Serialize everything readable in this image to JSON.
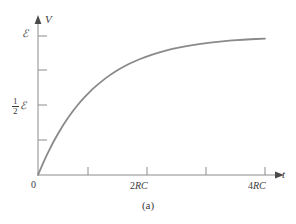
{
  "figure": {
    "caption": "(a)",
    "axis_color": "#8c8c8c",
    "curve_color": "#8a8a8a",
    "text_color": "#3c3c3c",
    "background": "#ffffff"
  },
  "axes": {
    "y_name": "V",
    "x_name": "t",
    "origin_label": "0"
  },
  "labels": {
    "emf": "ℰ",
    "half_numerator": "1",
    "half_denominator": "2",
    "tick_2rc_coeff": "2",
    "tick_2rc_unit": "RC",
    "tick_4rc_coeff": "4",
    "tick_4rc_unit": "RC"
  },
  "chart_data": {
    "type": "line",
    "title": "",
    "subtitle": "",
    "xlabel": "t",
    "ylabel": "V",
    "grid": false,
    "legend": null,
    "xlim": [
      0,
      4.6
    ],
    "ylim": [
      0,
      1.17
    ],
    "x_tick_values": [
      1,
      2,
      3,
      4
    ],
    "x_tick_labels": [
      "",
      "2RC",
      "",
      "4RC"
    ],
    "x_tick_unit": "RC",
    "y_tick_values": [
      0.25,
      0.5,
      0.75,
      1.0
    ],
    "y_tick_labels": [
      "",
      "½ℰ",
      "",
      "ℰ"
    ],
    "origin_label": "0",
    "annotations": [
      "(a)"
    ],
    "series": [
      {
        "name": "V(t) = ℰ(1 − e^(−t/RC))",
        "x": [
          0,
          0.1,
          0.2,
          0.3,
          0.4,
          0.5,
          0.6,
          0.7,
          0.8,
          0.9,
          1.0,
          1.2,
          1.4,
          1.6,
          1.8,
          2.0,
          2.25,
          2.5,
          2.75,
          3.0,
          3.25,
          3.5,
          3.75,
          4.0
        ],
        "y": [
          0,
          0.0952,
          0.1813,
          0.2592,
          0.3297,
          0.3935,
          0.4512,
          0.5034,
          0.5507,
          0.5934,
          0.6321,
          0.6988,
          0.7534,
          0.7981,
          0.8347,
          0.8647,
          0.8946,
          0.9179,
          0.9361,
          0.9502,
          0.9612,
          0.9698,
          0.9765,
          0.9817
        ]
      }
    ]
  }
}
